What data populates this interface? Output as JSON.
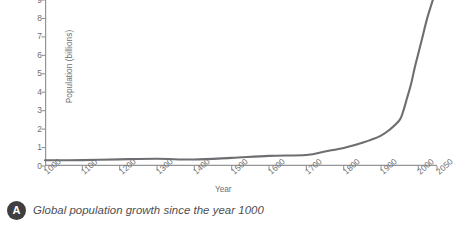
{
  "caption": {
    "badge": "A",
    "text": "Global population growth since the year 1000"
  },
  "colors": {
    "curve": "#6d6e71",
    "axis": "#939598",
    "text": "#6d6e71",
    "badge": "#3f3f41",
    "background": "#ffffff"
  },
  "chart_data": {
    "type": "line",
    "title": "",
    "xlabel": "Year",
    "ylabel": "Population (billions)",
    "xlim": [
      1000,
      2050
    ],
    "ylim": [
      0,
      9
    ],
    "grid": false,
    "legend": null,
    "xticks": [
      "1000",
      "1100",
      "1200",
      "1300",
      "1400",
      "1500",
      "1600",
      "1700",
      "1800",
      "1900",
      "2000",
      "2050"
    ],
    "xtick_values": [
      1000,
      1100,
      1200,
      1300,
      1400,
      1500,
      1600,
      1700,
      1800,
      1900,
      2000,
      2050
    ],
    "yticks": [
      "0",
      "1",
      "2",
      "3",
      "4",
      "5",
      "6",
      "7",
      "8",
      "9"
    ],
    "ytick_values": [
      0,
      1,
      2,
      3,
      4,
      5,
      6,
      7,
      8,
      9
    ],
    "series": [
      {
        "name": "World population",
        "x": [
          1000,
          1100,
          1200,
          1300,
          1400,
          1500,
          1600,
          1700,
          1750,
          1800,
          1850,
          1900,
          1925,
          1950,
          1960,
          1970,
          1980,
          1990,
          2000,
          2010,
          2025,
          2050
        ],
        "values": [
          0.31,
          0.32,
          0.36,
          0.39,
          0.35,
          0.44,
          0.55,
          0.6,
          0.79,
          0.98,
          1.26,
          1.65,
          2.0,
          2.5,
          3.0,
          3.7,
          4.4,
          5.3,
          6.1,
          6.9,
          8.1,
          9.7
        ]
      }
    ]
  }
}
